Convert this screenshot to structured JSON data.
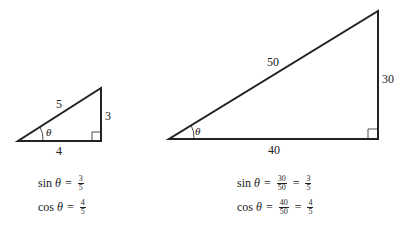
{
  "small_triangle": {
    "hypotenuse": "5",
    "opposite": "3",
    "adjacent": "4",
    "angle": "θ",
    "sin": {
      "fn": "sin",
      "var": "θ",
      "eq": "=",
      "num": "3",
      "den": "5"
    },
    "cos": {
      "fn": "cos",
      "var": "θ",
      "eq": "=",
      "num": "4",
      "den": "5"
    }
  },
  "large_triangle": {
    "hypotenuse": "50",
    "opposite": "30",
    "adjacent": "40",
    "angle": "θ",
    "sin": {
      "fn": "sin",
      "var": "θ",
      "eq": "=",
      "num1": "30",
      "den1": "50",
      "eq2": "=",
      "num2": "3",
      "den2": "5"
    },
    "cos": {
      "fn": "cos",
      "var": "θ",
      "eq": "=",
      "num1": "40",
      "den1": "50",
      "eq2": "=",
      "num2": "4",
      "den2": "5"
    }
  }
}
